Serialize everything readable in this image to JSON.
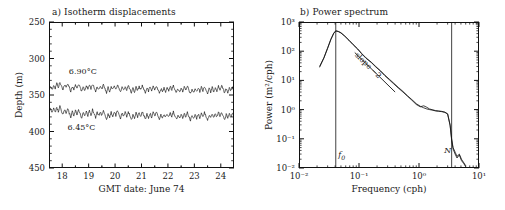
{
  "figure": {
    "panels": [
      {
        "tag": "a",
        "title": "a) Isotherm displacements",
        "xlabel": "GMT date: June 74",
        "ylabel": "Depth (m)",
        "xticks": [
          "18",
          "19",
          "20",
          "21",
          "22",
          "23",
          "24"
        ],
        "yticks": [
          "250",
          "300",
          "350",
          "400",
          "450"
        ],
        "series_labels": [
          "6.90°C",
          "6.45°C"
        ]
      },
      {
        "tag": "b",
        "title": "b) Power spectrum",
        "xlabel": "Frequency (cph)",
        "ylabel": "Power (m²/cph)",
        "slope_label": "slope −2",
        "marker_f0": "f",
        "marker_f0_sub": "0",
        "marker_N": "N"
      }
    ]
  },
  "chart_data": [
    {
      "type": "line",
      "title": "a) Isotherm displacements",
      "xlabel": "GMT date: June 74",
      "ylabel": "Depth (m)",
      "xlim": [
        17.5,
        24.5
      ],
      "ylim": [
        250,
        450
      ],
      "y_inverted": true,
      "xticks": [
        18,
        19,
        20,
        21,
        22,
        23,
        24
      ],
      "yticks": [
        250,
        300,
        350,
        400,
        450
      ],
      "grid": false,
      "legend": "inline-annotations",
      "series": [
        {
          "name": "6.90°C",
          "label_x": 18.45,
          "label_y": 318,
          "mean_depth": 340,
          "amplitude": 9,
          "values": [
            340,
            337,
            343,
            336,
            341,
            334,
            339,
            333,
            338,
            342,
            336,
            340,
            334,
            339,
            345,
            338,
            343,
            336,
            341,
            335,
            340,
            346,
            339,
            344,
            337,
            342,
            336,
            341,
            335,
            340,
            345,
            338,
            343,
            337,
            342,
            336,
            341,
            347,
            340,
            345,
            338,
            343,
            337,
            342,
            336,
            341,
            346,
            339,
            344,
            338,
            343,
            337,
            342,
            348,
            341,
            346,
            339,
            344,
            338,
            343,
            337,
            342,
            347,
            340,
            345,
            339,
            344,
            338,
            343,
            337,
            342,
            348,
            341,
            346,
            340,
            345,
            339,
            344,
            338,
            343,
            337,
            342,
            347,
            341,
            346,
            340,
            345,
            339,
            344,
            338,
            343,
            349,
            342,
            347,
            341,
            346,
            340,
            345,
            339,
            344,
            338,
            343,
            348,
            341,
            346,
            340,
            345,
            339,
            344,
            338,
            343,
            337,
            342,
            347,
            341,
            346,
            340,
            345,
            339,
            344
          ]
        },
        {
          "name": "6.45°C",
          "label_x": 18.35,
          "label_y": 395,
          "mean_depth": 376,
          "amplitude": 9,
          "values": [
            372,
            368,
            375,
            369,
            374,
            367,
            373,
            366,
            372,
            377,
            370,
            376,
            369,
            375,
            380,
            373,
            378,
            371,
            377,
            370,
            376,
            381,
            374,
            379,
            372,
            378,
            371,
            377,
            370,
            376,
            381,
            374,
            379,
            373,
            378,
            372,
            377,
            383,
            376,
            381,
            374,
            379,
            373,
            378,
            372,
            377,
            382,
            375,
            380,
            374,
            379,
            373,
            378,
            384,
            377,
            382,
            375,
            380,
            374,
            379,
            373,
            378,
            383,
            376,
            381,
            375,
            380,
            374,
            379,
            373,
            378,
            384,
            377,
            382,
            376,
            381,
            375,
            380,
            374,
            379,
            373,
            378,
            383,
            377,
            382,
            376,
            381,
            375,
            380,
            374,
            379,
            385,
            378,
            383,
            377,
            382,
            376,
            381,
            375,
            380,
            374,
            379,
            384,
            377,
            382,
            376,
            381,
            375,
            380,
            374,
            379,
            373,
            378,
            383,
            377,
            382,
            376,
            381,
            375,
            380
          ]
        }
      ]
    },
    {
      "type": "line",
      "title": "b) Power spectrum",
      "xlabel": "Frequency (cph)",
      "ylabel": "Power (m²/cph)",
      "xscale": "log",
      "yscale": "log",
      "xlim": [
        0.01,
        10
      ],
      "ylim": [
        0.01,
        1000
      ],
      "xticks": [
        0.01,
        0.1,
        1,
        10
      ],
      "xticklabels": [
        "10⁻²",
        "10⁻¹",
        "10⁰",
        "10¹"
      ],
      "yticks": [
        0.01,
        0.1,
        1,
        10,
        100,
        1000
      ],
      "yticklabels": [
        "10⁻²",
        "10⁻¹",
        "10⁰",
        "10¹",
        "10²",
        "10³"
      ],
      "grid": false,
      "annotations": [
        {
          "text": "slope −2",
          "type": "reference-line",
          "x1": 0.085,
          "y1": 90,
          "x2": 0.4,
          "y2": 4.0,
          "slope": -2
        },
        {
          "text": "f₀",
          "type": "vline",
          "x": 0.041,
          "label_y": 0.025
        },
        {
          "text": "N",
          "type": "vline",
          "x": 3.5,
          "label_y": 0.035
        }
      ],
      "series": [
        {
          "name": "spectrum",
          "x": [
            0.022,
            0.026,
            0.03,
            0.034,
            0.038,
            0.041,
            0.045,
            0.05,
            0.058,
            0.068,
            0.08,
            0.095,
            0.11,
            0.13,
            0.16,
            0.19,
            0.23,
            0.27,
            0.32,
            0.38,
            0.45,
            0.54,
            0.64,
            0.76,
            0.9,
            1.05,
            1.2,
            1.35,
            1.5,
            1.7,
            1.9,
            2.1,
            2.4,
            2.7,
            3.0,
            3.3,
            3.5,
            3.7,
            4.0,
            4.3,
            4.7,
            5.1,
            5.6,
            6.0
          ],
          "y": [
            30,
            60,
            130,
            260,
            420,
            500,
            480,
            430,
            330,
            240,
            170,
            120,
            85,
            60,
            42,
            30,
            21,
            15,
            11,
            8.0,
            5.8,
            4.2,
            3.0,
            2.2,
            1.6,
            1.3,
            1.15,
            1.05,
            1.0,
            0.95,
            0.9,
            0.88,
            0.85,
            0.8,
            0.7,
            0.3,
            0.1,
            0.05,
            0.035,
            0.025,
            0.03,
            0.02,
            0.015,
            0.012
          ]
        },
        {
          "name": "spectrum-second-isotherm",
          "x": [
            0.022,
            0.026,
            0.03,
            0.034,
            0.038,
            0.041,
            0.045,
            0.05,
            0.058,
            0.068,
            0.08,
            0.095,
            0.11,
            0.13,
            0.16,
            0.19,
            0.23,
            0.27,
            0.32,
            0.38,
            0.45,
            0.54,
            0.64,
            0.76,
            0.9,
            1.05,
            1.2,
            1.35,
            1.5,
            1.7,
            1.9,
            2.1,
            2.4,
            2.7,
            3.0,
            3.3,
            3.5,
            3.7,
            4.0,
            4.3,
            4.7,
            5.1,
            5.6,
            6.0
          ],
          "y": [
            28,
            58,
            125,
            250,
            410,
            490,
            470,
            420,
            325,
            235,
            165,
            118,
            83,
            58,
            41,
            29,
            20.5,
            14.5,
            10.5,
            7.6,
            5.5,
            4.0,
            2.9,
            2.1,
            1.5,
            1.25,
            1.35,
            1.2,
            1.05,
            0.98,
            0.92,
            0.9,
            0.87,
            0.82,
            0.72,
            0.28,
            0.09,
            0.045,
            0.03,
            0.022,
            0.028,
            0.018,
            0.014,
            0.011
          ]
        }
      ]
    }
  ]
}
